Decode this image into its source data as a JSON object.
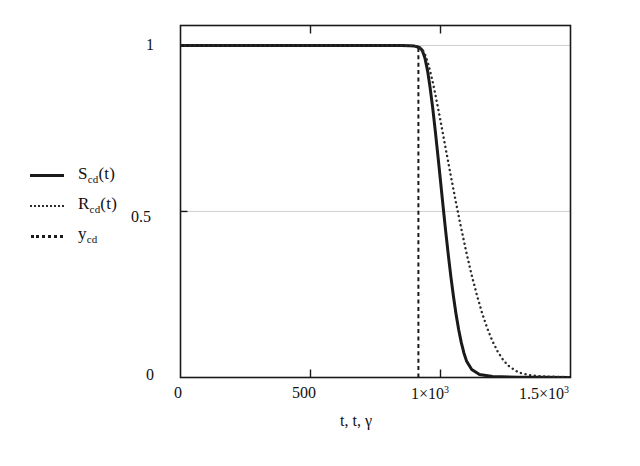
{
  "chart_data": {
    "type": "line",
    "title": "",
    "subtitle": "",
    "xlabel": "t, t, γ",
    "ylabel": "",
    "xlim": [
      0,
      1500
    ],
    "ylim": [
      0,
      1.06
    ],
    "grid": true,
    "grid_axis": "y",
    "legend_position": "outside-left",
    "x_ticks": [
      {
        "value": 0,
        "label": "0"
      },
      {
        "value": 500,
        "label": "500"
      },
      {
        "value": 1000,
        "label": "1×10",
        "exponent": "3"
      },
      {
        "value": 1500,
        "label": "1.5×10",
        "exponent": "3"
      }
    ],
    "y_ticks": [
      {
        "value": 0,
        "label": "0"
      },
      {
        "value": 0.5,
        "label": "0.5"
      },
      {
        "value": 1,
        "label": "1"
      }
    ],
    "series": [
      {
        "name": "S_cd(t)",
        "label_main": "S",
        "label_sub": "cd",
        "label_tail": "(t)",
        "style": "solid",
        "color": "#1a1a1a",
        "width": 3.0,
        "x": [
          0,
          100,
          200,
          300,
          400,
          500,
          600,
          700,
          800,
          850,
          880,
          900,
          910,
          920,
          930,
          940,
          950,
          960,
          970,
          980,
          990,
          1000,
          1010,
          1020,
          1030,
          1040,
          1050,
          1060,
          1070,
          1080,
          1090,
          1100,
          1120,
          1150,
          1200,
          1300,
          1400,
          1500
        ],
        "y": [
          1.0,
          1.0,
          1.0,
          1.0,
          1.0,
          1.0,
          1.0,
          1.0,
          1.0,
          1.0,
          0.999,
          0.998,
          0.996,
          0.993,
          0.985,
          0.962,
          0.925,
          0.873,
          0.812,
          0.742,
          0.668,
          0.592,
          0.515,
          0.44,
          0.369,
          0.303,
          0.243,
          0.19,
          0.144,
          0.105,
          0.074,
          0.05,
          0.024,
          0.009,
          0.003,
          0.001,
          0.0005,
          0.0003
        ]
      },
      {
        "name": "R_cd(t)",
        "label_main": "R",
        "label_sub": "cd",
        "label_tail": "(t)",
        "style": "dotted",
        "color": "#2a2a2a",
        "width": 2.4,
        "x": [
          0,
          100,
          200,
          300,
          400,
          500,
          600,
          700,
          800,
          850,
          880,
          900,
          910,
          920,
          930,
          940,
          950,
          960,
          970,
          980,
          990,
          1000,
          1020,
          1040,
          1060,
          1080,
          1100,
          1120,
          1140,
          1160,
          1180,
          1200,
          1220,
          1240,
          1260,
          1300,
          1350,
          1400,
          1500
        ],
        "y": [
          1.0,
          1.0,
          1.0,
          1.0,
          1.0,
          1.0,
          1.0,
          1.0,
          1.0,
          1.0,
          0.999,
          0.998,
          0.997,
          0.994,
          0.988,
          0.974,
          0.952,
          0.923,
          0.89,
          0.853,
          0.814,
          0.773,
          0.689,
          0.606,
          0.525,
          0.448,
          0.375,
          0.308,
          0.248,
          0.194,
          0.148,
          0.109,
          0.078,
          0.054,
          0.036,
          0.015,
          0.006,
          0.003,
          0.001
        ]
      },
      {
        "name": "y_cd",
        "label_main": "y",
        "label_sub": "cd",
        "label_tail": "",
        "style": "dashed",
        "color": "#1a1a1a",
        "width": 2.0,
        "vertical_line_at": 915,
        "x": [
          915,
          915
        ],
        "y": [
          0,
          1.0
        ]
      }
    ]
  }
}
